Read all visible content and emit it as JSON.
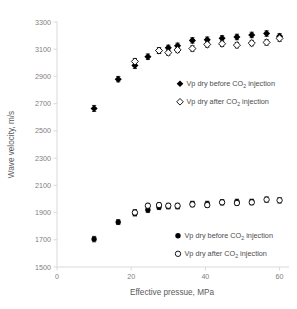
{
  "chart_data": {
    "type": "scatter",
    "title": "",
    "xlabel": "Effective pressue, MPa",
    "ylabel": "Wave velocity, m/s",
    "xlim": [
      0,
      62
    ],
    "ylim": [
      1500,
      3300
    ],
    "xticks": [
      0,
      20,
      40,
      60
    ],
    "yticks": [
      1500,
      1700,
      1900,
      2100,
      2300,
      2500,
      2700,
      2900,
      3100,
      3300
    ],
    "grid": false,
    "error_bars": "vertical, symmetric caps",
    "legend_position": "inside-right (two legends, one per group)",
    "series": [
      {
        "name": "Vp dry before CO2 injection",
        "group": "P-wave upper branch",
        "marker": "filled-diamond",
        "color": "#000000",
        "x": [
          10.0,
          16.5,
          21.0,
          24.5,
          27.5,
          30.0,
          32.5,
          36.5,
          40.5,
          44.5,
          48.5,
          52.5,
          56.5,
          60.0
        ],
        "y": [
          2665,
          2880,
          2980,
          3045,
          3090,
          3110,
          3125,
          3165,
          3170,
          3180,
          3190,
          3205,
          3215,
          3195
        ],
        "yerr": [
          22,
          20,
          22,
          20,
          20,
          20,
          20,
          20,
          20,
          20,
          20,
          20,
          20,
          20
        ]
      },
      {
        "name": "Vp dry after CO2 injection",
        "group": "P-wave upper branch",
        "marker": "open-diamond",
        "color": "#000000",
        "x": [
          21.0,
          27.5,
          30.0,
          32.5,
          36.5,
          40.5,
          44.5,
          48.5,
          52.5,
          56.5,
          60.0
        ],
        "y": [
          3010,
          3090,
          3075,
          3095,
          3105,
          3135,
          3140,
          3130,
          3145,
          3150,
          3180
        ],
        "yerr": [
          22,
          20,
          20,
          20,
          20,
          20,
          20,
          20,
          20,
          20,
          22
        ]
      },
      {
        "name": "Vp dry before CO2 injection",
        "group": "S-wave lower branch",
        "marker": "filled-circle",
        "color": "#000000",
        "x": [
          10.0,
          16.5,
          21.0,
          24.5,
          27.5,
          30.0,
          32.5,
          36.5,
          40.5,
          44.5,
          48.5,
          52.5
        ],
        "y": [
          1705,
          1830,
          1895,
          1920,
          1940,
          1945,
          1945,
          1965,
          1965,
          1975,
          1980,
          1980
        ],
        "yerr": [
          20,
          18,
          20,
          20,
          18,
          18,
          18,
          18,
          18,
          18,
          18,
          18
        ]
      },
      {
        "name": "Vp dry after CO2 injection",
        "group": "S-wave lower branch",
        "marker": "open-circle",
        "color": "#000000",
        "x": [
          21.0,
          24.5,
          27.5,
          30.0,
          32.5,
          36.5,
          40.5,
          44.5,
          48.5,
          52.5,
          56.5,
          60.0
        ],
        "y": [
          1900,
          1950,
          1955,
          1950,
          1950,
          1960,
          1955,
          1975,
          1970,
          1975,
          1995,
          1990
        ],
        "yerr": [
          22,
          18,
          18,
          18,
          18,
          18,
          18,
          18,
          18,
          18,
          20,
          20
        ]
      }
    ],
    "legends": [
      {
        "id": "legend-upper",
        "entries": [
          {
            "marker": "filled-diamond",
            "prefix": "Vp dry before CO",
            "sub": "2",
            "suffix": " injection"
          },
          {
            "marker": "open-diamond",
            "prefix": "Vp dry after CO",
            "sub": "2",
            "suffix": " injection"
          }
        ]
      },
      {
        "id": "legend-lower",
        "entries": [
          {
            "marker": "filled-circle",
            "prefix": "Vp dry before CO",
            "sub": "2",
            "suffix": " injection"
          },
          {
            "marker": "open-circle",
            "prefix": "Vp dry after CO",
            "sub": "2",
            "suffix": " injection"
          }
        ]
      }
    ]
  },
  "axes": {
    "x_tick_labels": [
      "0",
      "20",
      "40",
      "60"
    ],
    "y_tick_labels": [
      "1500",
      "1700",
      "1900",
      "2100",
      "2300",
      "2500",
      "2700",
      "2900",
      "3100",
      "3300"
    ],
    "x_title": "Effective pressue, MPa",
    "y_title": "Wave velocity, m/s"
  }
}
